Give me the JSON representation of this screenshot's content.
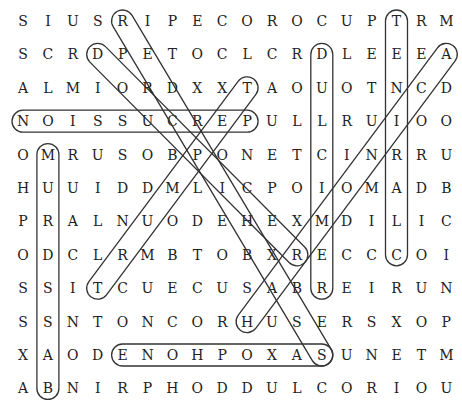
{
  "puzzle": {
    "type": "word-search",
    "grid": [
      "SIUSRIPECOROCUPTRM",
      "SCRDPETOCLCRDLEEEA",
      "ALMIORDXXTAOUOTNCD",
      "NOISSUCREPULLRUIOO",
      "OMRUSOBPONETCINRRU",
      "HUUIDDMLICPOIOMADB",
      "PRALNUODEHEXMDILIC",
      "ODCLRMBTOBXRECCCOI",
      "SSITCUECUSABREIRUN",
      "SSNTONCORHUSERSXOP",
      "XAODENOHPOXASUNETM",
      "ABNIRPHODDULCORIOU"
    ],
    "found_words": [
      {
        "word": "PERCUSSION",
        "from": [
          3,
          9
        ],
        "to": [
          3,
          0
        ]
      },
      {
        "word": "SAXOPHONE",
        "from": [
          10,
          12
        ],
        "to": [
          10,
          4
        ]
      },
      {
        "word": "BASSDRUM",
        "from": [
          11,
          1
        ],
        "to": [
          4,
          1
        ]
      },
      {
        "word": "DULCIMER",
        "from": [
          1,
          12
        ],
        "to": [
          8,
          12
        ]
      },
      {
        "word": "CLARINET",
        "from": [
          7,
          15
        ],
        "to": [
          0,
          15
        ]
      },
      {
        "word": "TPOS",
        "from": [
          2,
          9
        ],
        "to": [
          8,
          3
        ]
      },
      {
        "word": "RIPECORD",
        "from": [
          0,
          4
        ],
        "to": [
          10,
          12
        ]
      },
      {
        "word": "DPDIAG",
        "from": [
          1,
          3
        ],
        "to": [
          7,
          11
        ]
      },
      {
        "word": "ACIH",
        "from": [
          1,
          17
        ],
        "to": [
          9,
          9
        ]
      }
    ]
  }
}
